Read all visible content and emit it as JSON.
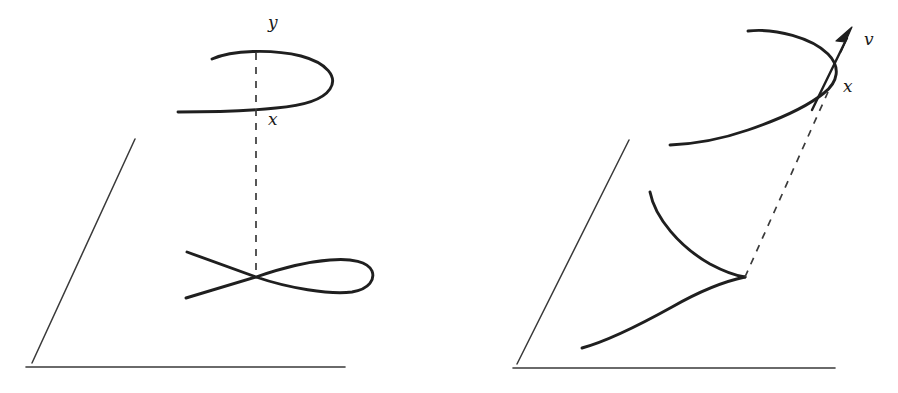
{
  "figure": {
    "background_color": "#ffffff",
    "stroke_color": "#1a1a1a",
    "curve_color": "#1f1f1f",
    "plane_color": "#3a3a3a",
    "dashed_color": "#3a3a3a",
    "width": 898,
    "height": 393
  },
  "panels": [
    {
      "id": "left-panel",
      "name": "nodal-cubic-blowup",
      "description": "Node singularity resolved by blowup: a plane with a nodal (self-crossing) curve and its spiral lift above",
      "plane": {
        "name": "base-plane",
        "corner": [
          32,
          363
        ],
        "left_edge_top": [
          135,
          139
        ],
        "bottom_edge_right": [
          345,
          367
        ]
      },
      "singular_curve": {
        "name": "nodal-cubic",
        "type": "node",
        "crossing_point": [
          256,
          277
        ],
        "left_upper_tail": [
          187,
          252
        ],
        "left_lower_tail": [
          186,
          298
        ],
        "loop_right_extent": [
          372,
          277
        ]
      },
      "lifted_curve": {
        "name": "spiral-lift",
        "type": "spiral",
        "top_start": [
          212,
          59
        ],
        "top_apex": [
          256,
          53
        ],
        "right_extent": [
          330,
          76
        ],
        "tail_end": [
          178,
          112
        ]
      },
      "projection_line": {
        "name": "projection-dashed-line",
        "style": "dashed",
        "from": [
          256,
          53
        ],
        "to": [
          256,
          277
        ]
      },
      "labels": [
        {
          "name": "label-y",
          "text": "y",
          "x": 268,
          "y": 28,
          "size": 17
        },
        {
          "name": "label-x",
          "text": "x",
          "x": 268,
          "y": 125,
          "size": 17
        }
      ]
    },
    {
      "id": "right-panel",
      "name": "cuspidal-cubic-blowup",
      "description": "Cusp singularity resolved by blowup: a plane with a cuspidal curve, its spiral lift above, and a tangent direction vector",
      "plane": {
        "name": "base-plane",
        "corner": [
          517,
          364
        ],
        "left_edge_top": [
          629,
          140
        ],
        "bottom_edge_right": [
          835,
          368
        ]
      },
      "singular_curve": {
        "name": "cuspidal-cubic",
        "type": "cusp",
        "cusp_point": [
          745,
          277
        ],
        "upper_branch_tail": [
          650,
          192
        ],
        "lower_branch_tail": [
          582,
          348
        ]
      },
      "lifted_curve": {
        "name": "spiral-lift",
        "type": "spiral",
        "top_start": [
          748,
          31
        ],
        "right_extent": [
          835,
          62
        ],
        "tail_end": [
          670,
          145
        ]
      },
      "projection_line": {
        "name": "projection-dashed-line",
        "style": "dashed",
        "from": [
          745,
          277
        ],
        "to": [
          828,
          92
        ]
      },
      "tangent_vector": {
        "name": "tangent-arrow",
        "from": [
          812,
          110
        ],
        "to": [
          852,
          28
        ],
        "arrowhead": true
      },
      "labels": [
        {
          "name": "label-v",
          "text": "v",
          "x": 864,
          "y": 45,
          "size": 17
        },
        {
          "name": "label-x",
          "text": "x",
          "x": 843,
          "y": 92,
          "size": 17
        }
      ]
    }
  ]
}
